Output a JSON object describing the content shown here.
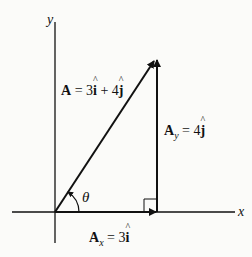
{
  "diagram": {
    "type": "vector-component-diagram",
    "axes": {
      "x_label": "x",
      "y_label": "y"
    },
    "vector": {
      "name": "A",
      "equals": "=",
      "x_coeff": "3",
      "x_unit": "i",
      "plus": "+",
      "y_coeff": "4",
      "y_unit": "j"
    },
    "x_component": {
      "name": "A",
      "subscript": "x",
      "equals": "=",
      "coeff": "3",
      "unit": "i"
    },
    "y_component": {
      "name": "A",
      "subscript": "y",
      "equals": "=",
      "coeff": "4",
      "unit": "j"
    },
    "angle_label": "θ",
    "colors": {
      "line": "#111111",
      "background": "#fbfbf9"
    }
  }
}
